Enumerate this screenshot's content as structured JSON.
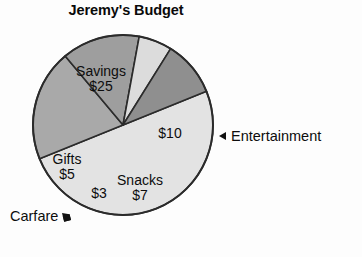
{
  "chart_data": {
    "type": "pie",
    "title": "Jeremy's Budget",
    "currency": "$",
    "total": 50,
    "start_angle_deg": -22,
    "direction": "clockwise",
    "center": {
      "x": 123,
      "y": 125
    },
    "radius": 90,
    "legend_position": "callout-labels",
    "grid": false,
    "categories": [
      "Savings",
      "Entertainment",
      "Snacks",
      "Carfare",
      "Gifts"
    ],
    "values": [
      25,
      10,
      7,
      3,
      5
    ],
    "value_labels": [
      "$25",
      "$10",
      "$7",
      "$3",
      "$5"
    ],
    "slices": [
      {
        "name": "Savings",
        "value": 25,
        "value_label": "$25",
        "percent": 50,
        "sweep_deg": 180,
        "color": "#e3e3e3",
        "label_placement": "inside",
        "show_name_inside": true
      },
      {
        "name": "Entertainment",
        "value": 10,
        "value_label": "$10",
        "percent": 20,
        "sweep_deg": 72,
        "color": "#a9a9a9",
        "label_placement": "callout-right",
        "show_name_inside": false
      },
      {
        "name": "Snacks",
        "value": 7,
        "value_label": "$7",
        "percent": 14,
        "sweep_deg": 50.4,
        "color": "#9e9e9e",
        "label_placement": "inside",
        "show_name_inside": true
      },
      {
        "name": "Carfare",
        "value": 3,
        "value_label": "$3",
        "percent": 6,
        "sweep_deg": 21.6,
        "color": "#dcdcdc",
        "label_placement": "callout-bottom-left",
        "show_name_inside": false
      },
      {
        "name": "Gifts",
        "value": 5,
        "value_label": "$5",
        "percent": 10,
        "sweep_deg": 36,
        "color": "#8f8f8f",
        "label_placement": "inside",
        "show_name_inside": true
      }
    ],
    "callouts": [
      {
        "name": "Entertainment",
        "text": "Entertainment",
        "arrow": "triangle-left",
        "points_to": "Entertainment"
      },
      {
        "name": "Carfare",
        "text": "Carfare",
        "arrow": "triangle-up-right",
        "points_to": "Carfare"
      }
    ],
    "colors": {
      "background": "#fdfdfd",
      "outline": "#2b2b2b",
      "text": "#0d0d0d"
    }
  }
}
